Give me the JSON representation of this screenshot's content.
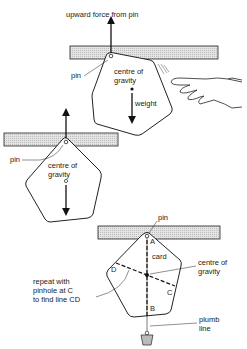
{
  "panel1": {
    "title": "upward force from pin",
    "pin": "pin",
    "cog_line1": "centre of",
    "cog_line2": "gravity",
    "weight": "weight"
  },
  "panel2": {
    "pin": "pin",
    "cog_line1": "centre of",
    "cog_line2": "gravity"
  },
  "panel3": {
    "pin": "pin",
    "point_a": "A",
    "point_b": "B",
    "point_c": "C",
    "point_d": "D",
    "card": "card",
    "cog_line1": "centre of",
    "cog_line2": "gravity",
    "repeat_line1": "repeat with",
    "repeat_line2": "pinhole at C",
    "repeat_line3": "to find line CD",
    "plumb_line1": "plumb",
    "plumb_line2": "line"
  }
}
